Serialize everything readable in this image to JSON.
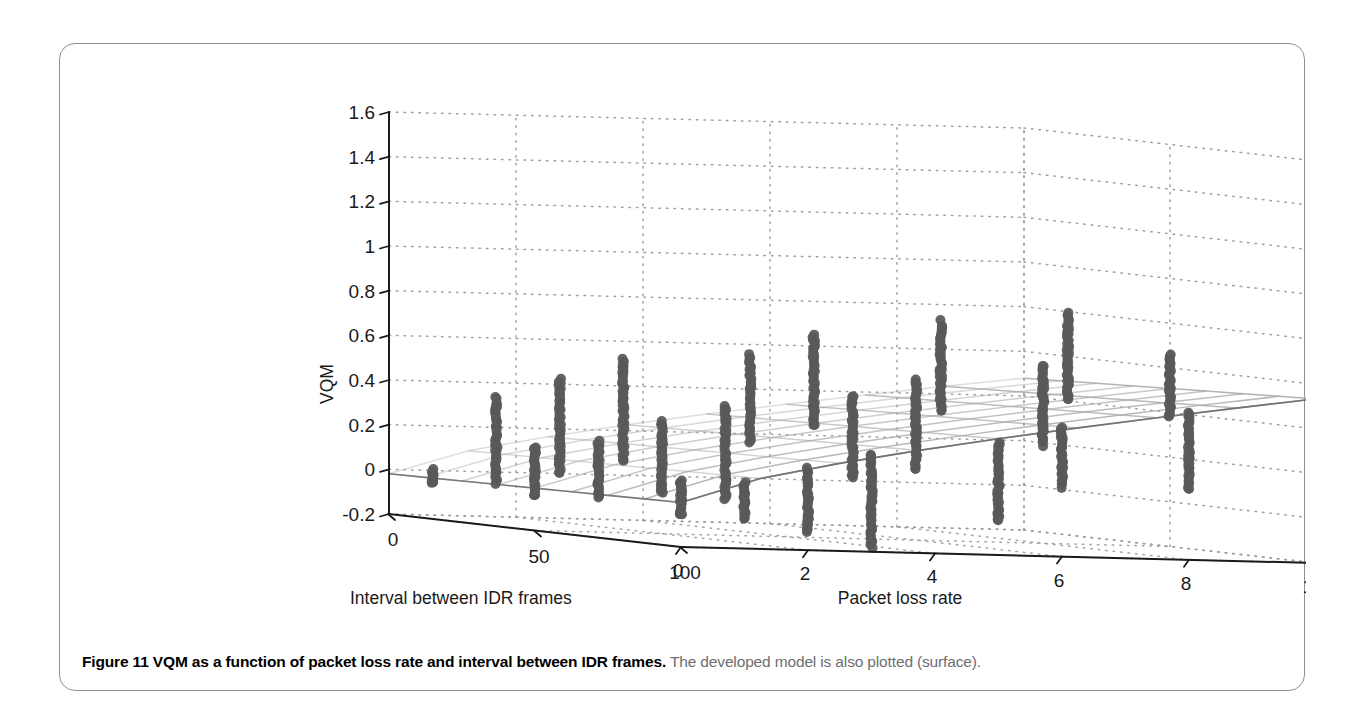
{
  "figure": {
    "caption_bold": "Figure 11 VQM as a function of packet loss rate and interval between IDR frames.",
    "caption_rest": " The developed model is also plotted (surface).",
    "border_color": "#8e9196"
  },
  "chart_data": {
    "type": "scatter",
    "render": "3d-scatter-with-surface",
    "title": "",
    "xlabel": "Packet loss rate",
    "ylabel": "Interval between IDR frames",
    "zlabel": "VQM",
    "xlim": [
      0,
      10
    ],
    "ylim": [
      0,
      100
    ],
    "zlim": [
      -0.2,
      1.6
    ],
    "xticks": [
      0,
      2,
      4,
      6,
      8,
      10
    ],
    "xtick_labels": [
      "0",
      "2",
      "4",
      "6",
      "8",
      "10"
    ],
    "yticks": [
      0,
      50,
      100
    ],
    "ytick_labels": [
      "0",
      "50",
      "100"
    ],
    "zticks": [
      -0.2,
      0,
      0.2,
      0.4,
      0.6,
      0.8,
      1,
      1.2,
      1.4,
      1.6
    ],
    "ztick_labels": [
      "-0.2",
      "0",
      "0.2",
      "0.4",
      "0.6",
      "0.8",
      "1",
      "1.2",
      "1.4",
      "1.6"
    ],
    "grid": true,
    "legend": "none",
    "point_color": "#595959",
    "surface_color": "#a8a8a8",
    "axis_color": "#1a1a1a",
    "grid_color": "#9a9a9a",
    "view": {
      "azimuth": -37.5,
      "elevation": 22
    },
    "series": [
      {
        "name": "VQM measurements",
        "type": "scatter",
        "columns": [
          "packet_loss_rate",
          "idr_interval",
          "vqm_min",
          "vqm_max"
        ],
        "points": [
          [
            0,
            15,
            -0.04,
            0.02
          ],
          [
            0,
            50,
            -0.05,
            0.17
          ],
          [
            0,
            100,
            -0.06,
            0.1
          ],
          [
            1,
            15,
            -0.03,
            0.35
          ],
          [
            1,
            50,
            -0.05,
            0.21
          ],
          [
            1,
            100,
            -0.07,
            0.09
          ],
          [
            2,
            15,
            0.02,
            0.44
          ],
          [
            2,
            50,
            -0.02,
            0.3
          ],
          [
            2,
            100,
            -0.12,
            0.17
          ],
          [
            3,
            15,
            0.08,
            0.54
          ],
          [
            3,
            50,
            -0.04,
            0.38
          ],
          [
            3,
            100,
            -0.18,
            0.24
          ],
          [
            5,
            15,
            0.18,
            0.57
          ],
          [
            5,
            50,
            0.07,
            0.44
          ],
          [
            5,
            100,
            -0.05,
            0.3
          ],
          [
            6,
            15,
            0.26,
            0.67
          ],
          [
            6,
            50,
            0.12,
            0.52
          ],
          [
            6,
            100,
            0.11,
            0.38
          ],
          [
            8,
            15,
            0.34,
            0.74
          ],
          [
            8,
            50,
            0.24,
            0.6
          ],
          [
            8,
            100,
            0.12,
            0.46
          ],
          [
            10,
            15,
            0.4,
            0.8
          ],
          [
            10,
            50,
            0.38,
            0.66
          ],
          [
            10,
            100,
            0.79,
            0.8
          ]
        ]
      },
      {
        "name": "Developed model (surface)",
        "type": "surface",
        "x_grid": [
          0,
          1.25,
          2.5,
          3.75,
          5,
          6.25,
          7.5,
          8.75,
          10
        ],
        "y_grid": [
          0,
          12.5,
          25,
          37.5,
          50,
          62.5,
          75,
          87.5,
          100
        ],
        "z_note": "VQM rises with packet loss rate, mildly with IDR interval; spans about -0.02 at origin to 0.50 at max loss"
      }
    ]
  }
}
